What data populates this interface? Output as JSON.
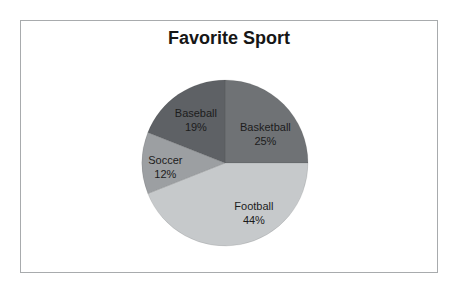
{
  "page": {
    "background": "#ffffff"
  },
  "frame": {
    "border_color": "#a8abad",
    "background": "#ffffff"
  },
  "chart_data": {
    "type": "pie",
    "title": "Favorite Sport",
    "title_color": "#161616",
    "label_color": "#1c1c1c",
    "start_angle_deg": 0,
    "direction": "clockwise",
    "legend": "none",
    "data_labels": "category name and percentage, inside slices",
    "slices": [
      {
        "label": "Basketball",
        "value": 25,
        "pct_label": "25%",
        "color": "#6f7275"
      },
      {
        "label": "Football",
        "value": 44,
        "pct_label": "44%",
        "color": "#c6c9cb"
      },
      {
        "label": "Soccer",
        "value": 12,
        "pct_label": "12%",
        "color": "#9c9fa2"
      },
      {
        "label": "Baseball",
        "value": 19,
        "pct_label": "19%",
        "color": "#5e6165"
      }
    ]
  }
}
